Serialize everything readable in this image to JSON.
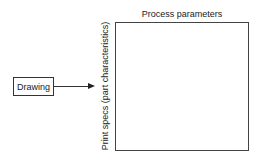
{
  "diagram": {
    "input_box": {
      "label": "Drawing"
    },
    "matrix": {
      "column_header": "Process parameters",
      "row_header": "Print specs (part characteristics)"
    },
    "connector": {
      "from": "Drawing",
      "to": "matrix",
      "type": "arrow"
    }
  }
}
